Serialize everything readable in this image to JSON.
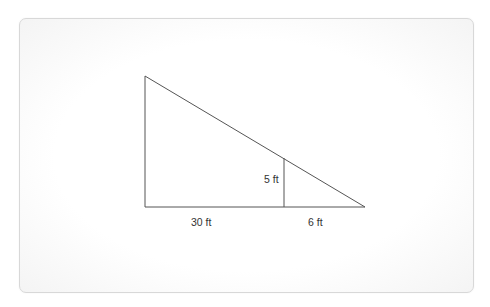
{
  "diagram": {
    "type": "similar-triangles",
    "colors": {
      "line": "#444444",
      "text": "#333333",
      "card_border": "#d8d8d8"
    },
    "labels": {
      "base_left": "30 ft",
      "base_right": "6 ft",
      "inner_height": "5 ft"
    },
    "geometry": {
      "large_triangle": {
        "top": [
          145,
          76
        ],
        "bottom_left": [
          145,
          207
        ],
        "bottom_right": [
          365,
          207
        ]
      },
      "inner_vertical": {
        "top": [
          284,
          158
        ],
        "bottom": [
          284,
          207
        ]
      }
    }
  }
}
